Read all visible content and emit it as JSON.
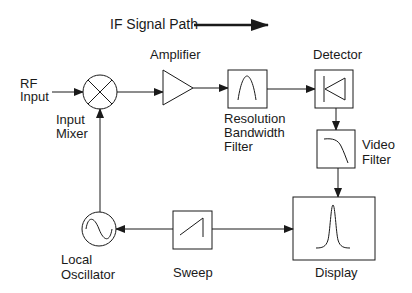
{
  "diagram": {
    "title": "IF Signal Path",
    "blocks": {
      "rf_input": {
        "label_line1": "RF",
        "label_line2": "Input"
      },
      "input_mixer": {
        "label_line1": "Input",
        "label_line2": "Mixer",
        "icon": "mixer-x-circle"
      },
      "amplifier": {
        "label": "Amplifier",
        "icon": "triangle-amplifier"
      },
      "resolution_bandwidth_filter": {
        "label_line1": "Resolution",
        "label_line2": "Bandwidth",
        "label_line3": "Filter",
        "icon": "bandpass-curve"
      },
      "detector": {
        "label": "Detector",
        "icon": "diode"
      },
      "video_filter": {
        "label_line1": "Video",
        "label_line2": "Filter",
        "icon": "lowpass-curve"
      },
      "display": {
        "label": "Display",
        "icon": "peak-trace"
      },
      "sweep": {
        "label": "Sweep",
        "icon": "sawtooth"
      },
      "local_oscillator": {
        "label_line1": "Local",
        "label_line2": "Oscillator",
        "icon": "sine-circle"
      }
    },
    "connections": [
      {
        "from": "RF Input",
        "to": "Input Mixer"
      },
      {
        "from": "Input Mixer",
        "to": "Amplifier"
      },
      {
        "from": "Amplifier",
        "to": "Resolution Bandwidth Filter"
      },
      {
        "from": "Resolution Bandwidth Filter",
        "to": "Detector"
      },
      {
        "from": "Detector",
        "to": "Video Filter"
      },
      {
        "from": "Video Filter",
        "to": "Display"
      },
      {
        "from": "Sweep",
        "to": "Display"
      },
      {
        "from": "Sweep",
        "to": "Local Oscillator"
      },
      {
        "from": "Local Oscillator",
        "to": "Input Mixer"
      }
    ]
  }
}
